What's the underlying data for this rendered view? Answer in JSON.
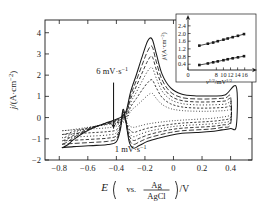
{
  "figure": {
    "type": "cyclic-voltammetry-figure",
    "background": "#ffffff",
    "line_color": "#1a1a1a"
  },
  "main_axes": {
    "xlabel_parts": {
      "symbol": "E",
      "vs": "vs.",
      "num": "Ag",
      "den": "AgCl",
      "unit": "/V"
    },
    "ylabel": "j/(A·cm",
    "ylabel_exp": "−2",
    "ylabel_tail": ")",
    "xticks": [
      "−0.8",
      "−0.6",
      "−0.4",
      "−0.2",
      "0",
      "0.2",
      "0.4"
    ],
    "xtick_values": [
      -0.8,
      -0.6,
      -0.4,
      -0.2,
      0,
      0.2,
      0.4
    ],
    "yticks": [
      "−2",
      "−1",
      "0",
      "1",
      "2",
      "3",
      "4"
    ],
    "ytick_values": [
      -2,
      -1,
      0,
      1,
      2,
      3,
      4
    ],
    "xlim": [
      -0.9,
      0.55
    ],
    "ylim": [
      -2,
      4.6
    ],
    "grid": false
  },
  "annotations": {
    "fast": "6 mV·s",
    "fast_exp": "−1",
    "slow": "1 mV·s",
    "slow_exp": "−1",
    "arrow_name": "scan-rate-direction-arrow"
  },
  "inset_axes": {
    "ylabel": "j/(A·cm",
    "ylabel_exp": "−2",
    "ylabel_tail": ")",
    "xlabel_sym": "ν",
    "xlabel_sym_exp": "1/2",
    "xlabel_unit": "/mV",
    "xlabel_unit_exp": "1/2",
    "yticks": [
      "0.4",
      "0.8",
      "1.2",
      "1.6",
      "2.0",
      "2.4"
    ],
    "ytick_values": [
      0.4,
      0.8,
      1.2,
      1.6,
      2.0,
      2.4
    ],
    "xticks": [
      "0",
      "8",
      "10",
      "12",
      "14",
      "16"
    ],
    "xtick_values": [
      0,
      8,
      10,
      12,
      14,
      16
    ],
    "xlim": [
      0,
      17.5
    ],
    "ylim": [
      0.1,
      2.6
    ],
    "grid": false
  },
  "chart_data": {
    "type": "line",
    "title": "",
    "xlabel": "E (vs. Ag/AgCl) / V",
    "ylabel": "j / (A·cm−2)",
    "xlim": [
      -0.9,
      0.55
    ],
    "ylim": [
      -2,
      4.6
    ],
    "grid": false,
    "legend": "none",
    "annotations": [
      "6 mV·s−1",
      "1 mV·s−1"
    ],
    "series": [
      {
        "name": "1 mV·s−1",
        "scan_rate": 1,
        "style": "dotted",
        "forward": [
          [
            -0.78,
            -0.62
          ],
          [
            -0.74,
            -0.6
          ],
          [
            -0.7,
            -0.56
          ],
          [
            -0.62,
            -0.48
          ],
          [
            -0.54,
            -0.4
          ],
          [
            -0.46,
            -0.33
          ],
          [
            -0.4,
            -0.28
          ],
          [
            -0.36,
            -0.24
          ],
          [
            -0.33,
            -0.1
          ],
          [
            -0.3,
            0.3
          ],
          [
            -0.26,
            0.55
          ],
          [
            -0.22,
            0.8
          ],
          [
            -0.18,
            1.05
          ],
          [
            -0.15,
            1.15
          ],
          [
            -0.12,
            0.9
          ],
          [
            -0.08,
            0.62
          ],
          [
            -0.02,
            0.42
          ],
          [
            0.06,
            0.33
          ],
          [
            0.16,
            0.3
          ],
          [
            0.26,
            0.3
          ],
          [
            0.36,
            0.33
          ],
          [
            0.4,
            0.36
          ]
        ],
        "reverse": [
          [
            0.4,
            0.12
          ],
          [
            0.34,
            0.02
          ],
          [
            0.26,
            -0.04
          ],
          [
            0.16,
            -0.08
          ],
          [
            0.06,
            -0.12
          ],
          [
            -0.02,
            -0.16
          ],
          [
            -0.1,
            -0.22
          ],
          [
            -0.18,
            -0.3
          ],
          [
            -0.24,
            -0.4
          ],
          [
            -0.28,
            -0.46
          ],
          [
            -0.31,
            -0.38
          ],
          [
            -0.34,
            -0.1
          ],
          [
            -0.355,
            0.05
          ],
          [
            -0.37,
            -0.15
          ],
          [
            -0.4,
            -0.4
          ],
          [
            -0.46,
            -0.48
          ],
          [
            -0.54,
            -0.52
          ],
          [
            -0.62,
            -0.55
          ],
          [
            -0.7,
            -0.58
          ],
          [
            -0.78,
            -0.62
          ]
        ]
      },
      {
        "name": "2 mV·s−1",
        "scan_rate": 2,
        "style": "dashed-fine",
        "forward": [
          [
            -0.78,
            -0.8
          ],
          [
            -0.74,
            -0.75
          ],
          [
            -0.7,
            -0.65
          ],
          [
            -0.62,
            -0.52
          ],
          [
            -0.54,
            -0.4
          ],
          [
            -0.46,
            -0.3
          ],
          [
            -0.4,
            -0.24
          ],
          [
            -0.36,
            -0.18
          ],
          [
            -0.33,
            0.0
          ],
          [
            -0.3,
            0.5
          ],
          [
            -0.26,
            0.9
          ],
          [
            -0.22,
            1.3
          ],
          [
            -0.18,
            1.65
          ],
          [
            -0.15,
            1.78
          ],
          [
            -0.12,
            1.4
          ],
          [
            -0.08,
            0.95
          ],
          [
            -0.02,
            0.65
          ],
          [
            0.06,
            0.5
          ],
          [
            0.16,
            0.45
          ],
          [
            0.26,
            0.45
          ],
          [
            0.36,
            0.48
          ],
          [
            0.4,
            0.52
          ]
        ],
        "reverse": [
          [
            0.4,
            0.0
          ],
          [
            0.34,
            -0.12
          ],
          [
            0.26,
            -0.18
          ],
          [
            0.16,
            -0.22
          ],
          [
            0.06,
            -0.26
          ],
          [
            -0.02,
            -0.32
          ],
          [
            -0.1,
            -0.4
          ],
          [
            -0.18,
            -0.5
          ],
          [
            -0.24,
            -0.62
          ],
          [
            -0.28,
            -0.7
          ],
          [
            -0.31,
            -0.55
          ],
          [
            -0.34,
            -0.05
          ],
          [
            -0.355,
            0.12
          ],
          [
            -0.37,
            -0.25
          ],
          [
            -0.4,
            -0.58
          ],
          [
            -0.46,
            -0.66
          ],
          [
            -0.54,
            -0.7
          ],
          [
            -0.62,
            -0.73
          ],
          [
            -0.7,
            -0.76
          ],
          [
            -0.78,
            -0.8
          ]
        ]
      },
      {
        "name": "3 mV·s−1",
        "scan_rate": 3,
        "style": "dotted-coarse",
        "forward": [
          [
            -0.78,
            -0.95
          ],
          [
            -0.74,
            -0.88
          ],
          [
            -0.7,
            -0.74
          ],
          [
            -0.62,
            -0.55
          ],
          [
            -0.54,
            -0.4
          ],
          [
            -0.46,
            -0.28
          ],
          [
            -0.4,
            -0.2
          ],
          [
            -0.36,
            -0.12
          ],
          [
            -0.33,
            0.1
          ],
          [
            -0.3,
            0.7
          ],
          [
            -0.26,
            1.2
          ],
          [
            -0.22,
            1.72
          ],
          [
            -0.18,
            2.2
          ],
          [
            -0.15,
            2.35
          ],
          [
            -0.12,
            1.85
          ],
          [
            -0.08,
            1.25
          ],
          [
            -0.02,
            0.85
          ],
          [
            0.06,
            0.66
          ],
          [
            0.16,
            0.6
          ],
          [
            0.26,
            0.6
          ],
          [
            0.36,
            0.63
          ],
          [
            0.4,
            0.68
          ]
        ],
        "reverse": [
          [
            0.4,
            -0.1
          ],
          [
            0.34,
            -0.24
          ],
          [
            0.26,
            -0.3
          ],
          [
            0.16,
            -0.34
          ],
          [
            0.06,
            -0.38
          ],
          [
            -0.02,
            -0.44
          ],
          [
            -0.1,
            -0.54
          ],
          [
            -0.18,
            -0.66
          ],
          [
            -0.24,
            -0.8
          ],
          [
            -0.28,
            -0.9
          ],
          [
            -0.31,
            -0.7
          ],
          [
            -0.34,
            -0.02
          ],
          [
            -0.355,
            0.18
          ],
          [
            -0.37,
            -0.32
          ],
          [
            -0.4,
            -0.72
          ],
          [
            -0.46,
            -0.82
          ],
          [
            -0.54,
            -0.86
          ],
          [
            -0.62,
            -0.89
          ],
          [
            -0.7,
            -0.92
          ],
          [
            -0.78,
            -0.95
          ]
        ]
      },
      {
        "name": "4 mV·s−1",
        "scan_rate": 4,
        "style": "dashed",
        "forward": [
          [
            -0.78,
            -1.1
          ],
          [
            -0.74,
            -1.0
          ],
          [
            -0.7,
            -0.84
          ],
          [
            -0.62,
            -0.6
          ],
          [
            -0.54,
            -0.41
          ],
          [
            -0.46,
            -0.26
          ],
          [
            -0.4,
            -0.16
          ],
          [
            -0.36,
            -0.06
          ],
          [
            -0.33,
            0.18
          ],
          [
            -0.3,
            0.88
          ],
          [
            -0.26,
            1.48
          ],
          [
            -0.22,
            2.1
          ],
          [
            -0.18,
            2.68
          ],
          [
            -0.15,
            2.88
          ],
          [
            -0.12,
            2.25
          ],
          [
            -0.08,
            1.52
          ],
          [
            -0.02,
            1.02
          ],
          [
            0.06,
            0.8
          ],
          [
            0.16,
            0.74
          ],
          [
            0.26,
            0.74
          ],
          [
            0.36,
            0.78
          ],
          [
            0.4,
            0.84
          ]
        ],
        "reverse": [
          [
            0.4,
            -0.2
          ],
          [
            0.34,
            -0.35
          ],
          [
            0.26,
            -0.42
          ],
          [
            0.16,
            -0.46
          ],
          [
            0.06,
            -0.5
          ],
          [
            -0.02,
            -0.57
          ],
          [
            -0.1,
            -0.68
          ],
          [
            -0.18,
            -0.82
          ],
          [
            -0.24,
            -0.98
          ],
          [
            -0.28,
            -1.08
          ],
          [
            -0.31,
            -0.85
          ],
          [
            -0.34,
            0.02
          ],
          [
            -0.355,
            0.24
          ],
          [
            -0.37,
            -0.38
          ],
          [
            -0.4,
            -0.86
          ],
          [
            -0.46,
            -0.97
          ],
          [
            -0.54,
            -1.01
          ],
          [
            -0.62,
            -1.04
          ],
          [
            -0.7,
            -1.07
          ],
          [
            -0.78,
            -1.1
          ]
        ]
      },
      {
        "name": "5 mV·s−1",
        "scan_rate": 5,
        "style": "dashed-long",
        "forward": [
          [
            -0.78,
            -1.26
          ],
          [
            -0.74,
            -1.14
          ],
          [
            -0.7,
            -0.94
          ],
          [
            -0.62,
            -0.64
          ],
          [
            -0.54,
            -0.42
          ],
          [
            -0.46,
            -0.24
          ],
          [
            -0.4,
            -0.12
          ],
          [
            -0.36,
            0.0
          ],
          [
            -0.33,
            0.26
          ],
          [
            -0.3,
            1.05
          ],
          [
            -0.26,
            1.75
          ],
          [
            -0.22,
            2.48
          ],
          [
            -0.18,
            3.15
          ],
          [
            -0.15,
            3.35
          ],
          [
            -0.12,
            2.62
          ],
          [
            -0.08,
            1.78
          ],
          [
            -0.02,
            1.2
          ],
          [
            0.06,
            0.94
          ],
          [
            0.16,
            0.88
          ],
          [
            0.26,
            0.88
          ],
          [
            0.36,
            0.92
          ],
          [
            0.4,
            0.98
          ]
        ],
        "reverse": [
          [
            0.4,
            -0.3
          ],
          [
            0.34,
            -0.46
          ],
          [
            0.26,
            -0.54
          ],
          [
            0.16,
            -0.58
          ],
          [
            0.06,
            -0.62
          ],
          [
            -0.02,
            -0.7
          ],
          [
            -0.1,
            -0.82
          ],
          [
            -0.18,
            -0.97
          ],
          [
            -0.24,
            -1.15
          ],
          [
            -0.28,
            -1.26
          ],
          [
            -0.31,
            -1.0
          ],
          [
            -0.34,
            0.06
          ],
          [
            -0.355,
            0.3
          ],
          [
            -0.37,
            -0.44
          ],
          [
            -0.4,
            -1.0
          ],
          [
            -0.46,
            -1.12
          ],
          [
            -0.54,
            -1.16
          ],
          [
            -0.62,
            -1.19
          ],
          [
            -0.7,
            -1.22
          ],
          [
            -0.78,
            -1.26
          ]
        ]
      },
      {
        "name": "6 mV·s−1",
        "scan_rate": 6,
        "style": "solid",
        "forward": [
          [
            -0.78,
            -1.42
          ],
          [
            -0.74,
            -1.28
          ],
          [
            -0.7,
            -1.04
          ],
          [
            -0.62,
            -0.68
          ],
          [
            -0.54,
            -0.42
          ],
          [
            -0.46,
            -0.22
          ],
          [
            -0.4,
            -0.08
          ],
          [
            -0.36,
            0.06
          ],
          [
            -0.33,
            0.34
          ],
          [
            -0.3,
            1.22
          ],
          [
            -0.26,
            2.02
          ],
          [
            -0.22,
            2.86
          ],
          [
            -0.18,
            3.62
          ],
          [
            -0.15,
            3.7
          ],
          [
            -0.12,
            3.0
          ],
          [
            -0.08,
            2.05
          ],
          [
            -0.02,
            1.4
          ],
          [
            0.06,
            1.1
          ],
          [
            0.16,
            1.02
          ],
          [
            0.26,
            1.02
          ],
          [
            0.36,
            1.06
          ],
          [
            0.44,
            1.45
          ]
        ],
        "reverse": [
          [
            0.44,
            -0.4
          ],
          [
            0.4,
            -0.52
          ],
          [
            0.34,
            -0.58
          ],
          [
            0.26,
            -0.66
          ],
          [
            0.16,
            -0.7
          ],
          [
            0.06,
            -0.74
          ],
          [
            -0.02,
            -0.83
          ],
          [
            -0.1,
            -0.96
          ],
          [
            -0.18,
            -1.12
          ],
          [
            -0.24,
            -1.32
          ],
          [
            -0.28,
            -1.44
          ],
          [
            -0.31,
            -1.15
          ],
          [
            -0.34,
            0.1
          ],
          [
            -0.355,
            0.36
          ],
          [
            -0.37,
            -0.5
          ],
          [
            -0.4,
            -1.14
          ],
          [
            -0.46,
            -1.27
          ],
          [
            -0.54,
            -1.31
          ],
          [
            -0.62,
            -1.34
          ],
          [
            -0.7,
            -1.37
          ],
          [
            -0.78,
            -1.42
          ]
        ]
      }
    ]
  },
  "inset_chart_data": {
    "type": "scatter",
    "title": "",
    "xlabel": "ν1/2 / mV1/2·s−1/2",
    "ylabel": "j / (A·cm−2)",
    "xlim": [
      0,
      17.5
    ],
    "ylim": [
      0.1,
      2.6
    ],
    "grid": false,
    "marker": "square",
    "series": [
      {
        "name": "anodic-peak-current",
        "x": [
          3.2,
          5.6,
          7.1,
          8.4,
          10.0,
          11.2,
          12.6,
          14.1,
          15.8
        ],
        "y": [
          1.37,
          1.47,
          1.53,
          1.6,
          1.68,
          1.74,
          1.81,
          1.88,
          1.97
        ]
      },
      {
        "name": "cathodic-peak-current",
        "x": [
          3.2,
          5.6,
          7.1,
          8.4,
          10.0,
          11.2,
          12.6,
          14.1,
          15.8
        ],
        "y": [
          0.36,
          0.44,
          0.5,
          0.55,
          0.61,
          0.66,
          0.71,
          0.76,
          0.82
        ]
      }
    ]
  }
}
